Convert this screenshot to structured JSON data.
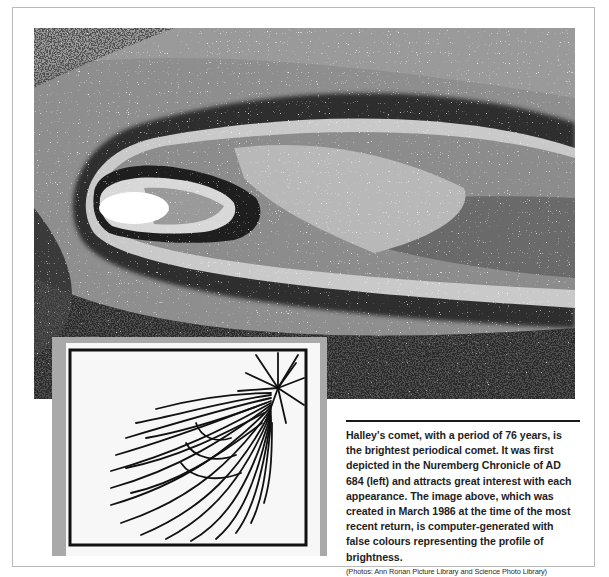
{
  "figure": {
    "main_photo": {
      "subject": "Halley's comet, computer-generated false-colour brightness image",
      "icon": "comet-photo"
    },
    "inset_photo": {
      "subject": "Woodcut from the Nuremberg Chronicle depicting comet of AD 684",
      "icon": "woodcut-comet"
    },
    "caption": {
      "body": "Halley's comet, with a period of 76 years, is the brightest periodical comet. It was first depicted in the Nuremberg Chronicle of AD 684 (left) and attracts great interest with each appearance. The image above, which was created in March 1986 at the time of the most recent return, is computer-generated with false colours representing the profile of brightness.",
      "credit": "(Photos: Ann Ronan Picture Library and Science Photo Library)"
    }
  },
  "colors": {
    "frame_border": "#b9b9b9",
    "inset_frame": "#a9a9a9",
    "caption_text": "#1e1e1e",
    "rule": "#1a1a1a"
  }
}
